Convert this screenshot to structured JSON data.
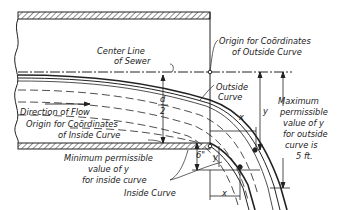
{
  "diagram": {
    "type": "engineering-drawing",
    "labels": {
      "center_line_1": "Center Line",
      "center_line_2": "of Sewer",
      "origin_outside_1": "Origin for Coördinates",
      "origin_outside_2": "of Outside Curve",
      "outside_curve_1": "Outside",
      "outside_curve_2": "Curve",
      "direction_flow": "Direction of Flow",
      "origin_inside_1": "Origin for Coördinates",
      "origin_inside_2": "of Inside Curve",
      "min_perm_1": "Minimum permissible",
      "min_perm_2": "value of y",
      "min_perm_3": "for inside curve",
      "inside_curve": "Inside Curve",
      "max_perm_1": "Maximum",
      "max_perm_2": "permissible",
      "max_perm_3": "value of y",
      "max_perm_4": "for outside",
      "max_perm_5": "curve is",
      "max_perm_6": "5 ft.",
      "d_num": "d",
      "d_den": "2",
      "six_inch": "6\"",
      "y_outer": "y",
      "x_outer": "x",
      "y_inner": "y",
      "x_inner": "x"
    },
    "colors": {
      "ink": "#222222",
      "background": "#ffffff"
    }
  }
}
